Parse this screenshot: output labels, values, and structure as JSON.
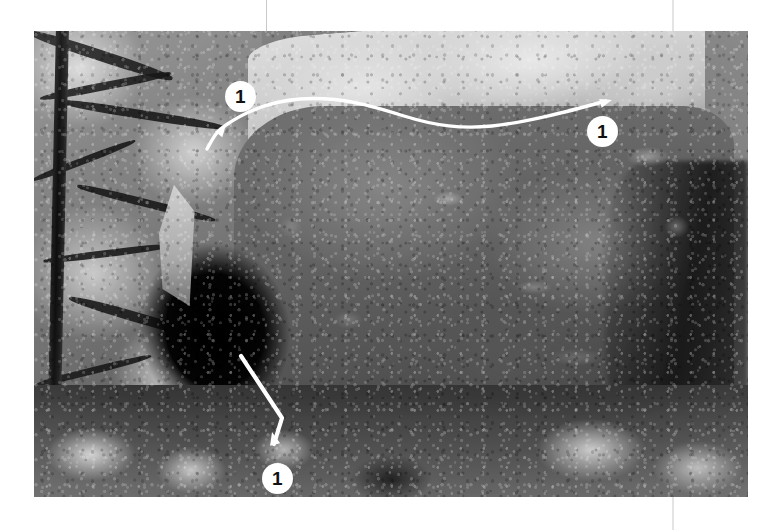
{
  "page": {
    "width": 781,
    "height": 530,
    "background_color": "#ffffff",
    "rules": [
      {
        "name": "column-rule-left",
        "x": 266,
        "y": 0,
        "height": 34,
        "color": "#c9c9c9"
      },
      {
        "name": "column-rule-right-top",
        "x": 672,
        "y": 0,
        "height": 31,
        "color": "#e4e4e4"
      },
      {
        "name": "column-rule-right-bottom",
        "x": 672,
        "y": 497,
        "height": 33,
        "color": "#e4e4e4"
      }
    ]
  },
  "photo": {
    "name": "boulder-topo-photograph",
    "alt": "Black and white photograph of a large granite boulder with a climber in shadow beneath the left overhang",
    "frame": {
      "left": 34,
      "top": 31,
      "width": 714,
      "height": 466
    },
    "colorspace": "grayscale"
  },
  "annotations": {
    "line_color": "#ffffff",
    "marker_fill": "#ffffff",
    "marker_text_color": "#111111",
    "markers": [
      {
        "name": "route-marker-start",
        "label": "1",
        "x": 240,
        "y": 96,
        "placement": "top-left"
      },
      {
        "name": "route-marker-finish",
        "label": "1",
        "x": 602,
        "y": 131,
        "placement": "top-right"
      },
      {
        "name": "route-marker-base",
        "label": "1",
        "x": 277,
        "y": 478,
        "placement": "bottom-left"
      }
    ],
    "routes": [
      {
        "name": "route-1-traverse",
        "label": "1",
        "description": "Lip traverse line across the top of the boulder",
        "path": "M 207 149 C 212 140, 216 131, 226 125 C 248 110, 274 101, 300 99 C 340 96, 372 106, 404 116 C 436 126, 462 129, 492 126 C 528 122, 566 112, 606 101",
        "arrowheads": [
          {
            "name": "arrowhead-lip-start",
            "x": 226,
            "y": 125,
            "angle": -52
          },
          {
            "name": "arrowhead-lip-finish",
            "x": 610,
            "y": 100,
            "angle": -16
          }
        ]
      },
      {
        "name": "route-1-start-arrow",
        "label": "1",
        "description": "Arrow marking the sit-start holds at the base",
        "path": "M 241 356 L 282 418 L 274 444",
        "arrowheads": [
          {
            "name": "arrowhead-base-start",
            "x": 273,
            "y": 437,
            "angle": -104
          }
        ]
      }
    ]
  }
}
